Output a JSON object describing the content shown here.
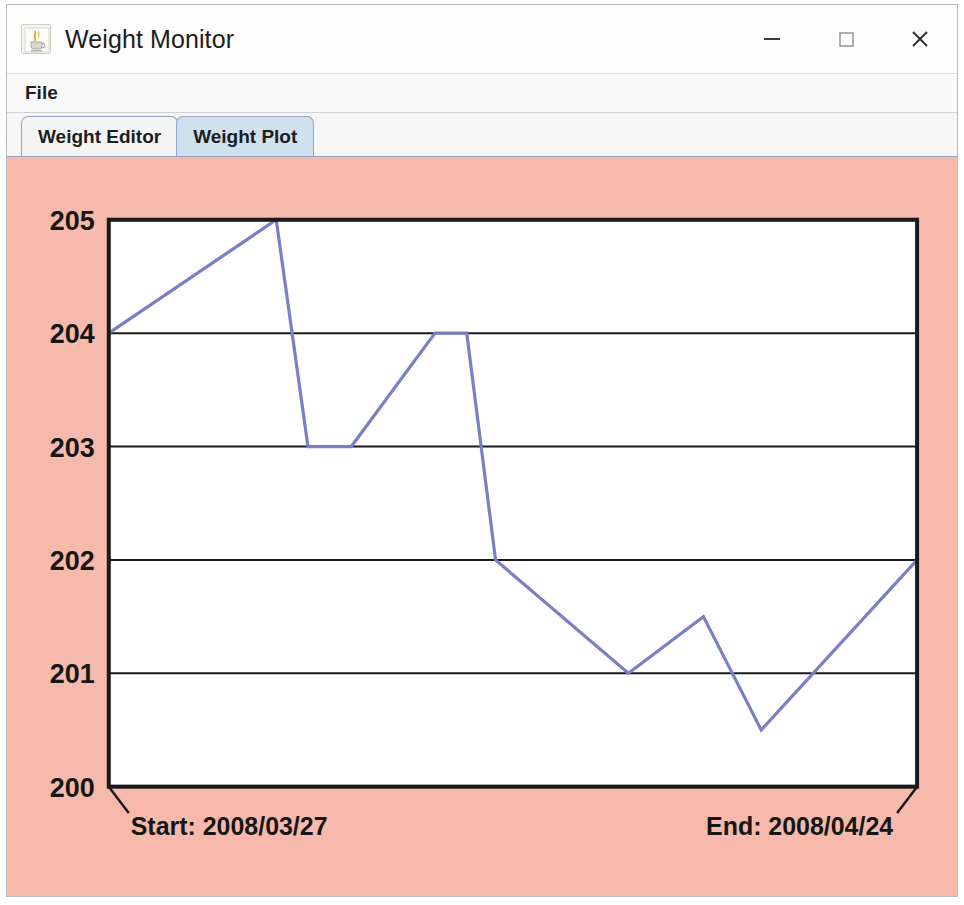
{
  "window": {
    "title": "Weight Monitor",
    "app_icon": "java-coffee-cup-icon",
    "controls": {
      "minimize": "minimize-icon",
      "maximize": "maximize-icon",
      "close": "close-icon"
    }
  },
  "menubar": {
    "items": [
      {
        "label": "File"
      }
    ]
  },
  "tabs": [
    {
      "label": "Weight Editor",
      "active": false
    },
    {
      "label": "Weight Plot",
      "active": true
    }
  ],
  "plot": {
    "start_label": "Start: 2008/03/27",
    "end_label": "End: 2008/04/24",
    "panel_color": "#f6b9ab",
    "line_color": "#7b7fc4",
    "axis_color": "#1a1a1a",
    "plot_background": "#ffffff"
  },
  "chart_data": {
    "type": "line",
    "title": "",
    "xlabel": "",
    "ylabel": "",
    "ylim": [
      200,
      205
    ],
    "xlim": [
      0,
      28
    ],
    "grid": true,
    "legend": null,
    "yticks": [
      205,
      204,
      203,
      202,
      201,
      200
    ],
    "xticks": [
      "2008/03/27",
      "2008/04/24"
    ],
    "x_start_date": "2008/03/27",
    "x_end_date": "2008/04/24",
    "series": [
      {
        "name": "Weight",
        "x": [
          0,
          5.8,
          6.9,
          8.4,
          11.3,
          12.4,
          13.4,
          18.0,
          20.6,
          22.6,
          24.5,
          28.0
        ],
        "values": [
          204,
          205,
          203,
          203,
          204,
          204,
          202,
          201,
          201.5,
          200.5,
          201,
          202
        ]
      }
    ],
    "points": [
      {
        "x": 0,
        "y": 204
      },
      {
        "x": 5.8,
        "y": 205
      },
      {
        "x": 6.9,
        "y": 203
      },
      {
        "x": 8.4,
        "y": 203
      },
      {
        "x": 11.3,
        "y": 204
      },
      {
        "x": 12.4,
        "y": 204
      },
      {
        "x": 13.4,
        "y": 202
      },
      {
        "x": 18.0,
        "y": 201
      },
      {
        "x": 20.6,
        "y": 201.5
      },
      {
        "x": 22.6,
        "y": 200.5
      },
      {
        "x": 28.0,
        "y": 202
      }
    ]
  }
}
